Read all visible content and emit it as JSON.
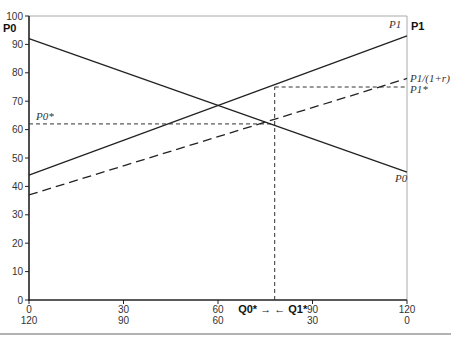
{
  "chart_data": {
    "type": "line",
    "title": "",
    "xlabel": "",
    "ylabel_left": "P0",
    "ylabel_right": "P1",
    "ylim": [
      0,
      100
    ],
    "xlim": [
      0,
      120
    ],
    "y_ticks": [
      0,
      10,
      20,
      30,
      40,
      50,
      60,
      70,
      80,
      90,
      100
    ],
    "x_ticks_top_row": [
      "0",
      "30",
      "60",
      "90",
      "120"
    ],
    "x_ticks_bottom_row": [
      "120",
      "90",
      "60",
      "30",
      "0"
    ],
    "grid": false,
    "series": [
      {
        "name": "P0",
        "style": "solid",
        "x": [
          0,
          120
        ],
        "y": [
          92,
          45
        ]
      },
      {
        "name": "P1",
        "style": "solid",
        "x": [
          0,
          120
        ],
        "y": [
          44,
          93
        ]
      },
      {
        "name": "P1/(1+r)",
        "style": "dashed",
        "x": [
          0,
          120
        ],
        "y": [
          37,
          78
        ]
      }
    ],
    "reference_lines": [
      {
        "name": "P0*",
        "style": "dotted",
        "x": [
          0,
          78
        ],
        "y": [
          62,
          62
        ]
      },
      {
        "name": "P1*",
        "style": "dotted",
        "x": [
          78,
          120
        ],
        "y": [
          75,
          75
        ]
      },
      {
        "name": "Q*",
        "style": "dotted",
        "x": [
          78,
          78
        ],
        "y": [
          0,
          75
        ]
      }
    ],
    "annotations": {
      "p0_star": "P0*",
      "p1_star": "P1*",
      "p1_disc": "P1/(1+r)",
      "p1_line": "P1",
      "p0_line": "P0",
      "q0_star": "Q0*",
      "q1_star": "Q1*",
      "arrows": "Q0* → ← Q1*"
    }
  }
}
